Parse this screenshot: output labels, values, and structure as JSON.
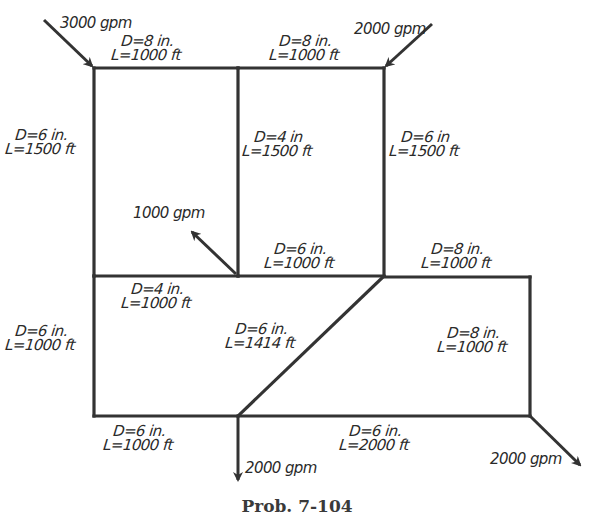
{
  "caption": "Prob. 7-104",
  "colors": {
    "line": "#333333",
    "text": "#2a2a2a",
    "background": "#ffffff"
  },
  "nodes": [
    {
      "id": "A",
      "x": 94,
      "y": 68
    },
    {
      "id": "B",
      "x": 238,
      "y": 68
    },
    {
      "id": "C",
      "x": 384,
      "y": 68
    },
    {
      "id": "D",
      "x": 94,
      "y": 276
    },
    {
      "id": "E",
      "x": 238,
      "y": 276
    },
    {
      "id": "F",
      "x": 384,
      "y": 276
    },
    {
      "id": "G",
      "x": 530,
      "y": 277
    },
    {
      "id": "H",
      "x": 94,
      "y": 416
    },
    {
      "id": "I",
      "x": 238,
      "y": 416
    },
    {
      "id": "J",
      "x": 530,
      "y": 416
    }
  ],
  "pipes": [
    {
      "from": "A",
      "to": "B",
      "diameter": "D=8 in.",
      "length": "L=1000 ft"
    },
    {
      "from": "B",
      "to": "C",
      "diameter": "D=8 in.",
      "length": "L=1000 ft"
    },
    {
      "from": "A",
      "to": "D",
      "diameter": "D=6 in.",
      "length": "L=1500 ft"
    },
    {
      "from": "B",
      "to": "E",
      "diameter": "D=4 in",
      "length": "L=1500 ft"
    },
    {
      "from": "C",
      "to": "F",
      "diameter": "D=6 in",
      "length": "L=1500 ft"
    },
    {
      "from": "E",
      "to": "F",
      "diameter": "D=6 in.",
      "length": "L=1000 ft"
    },
    {
      "from": "F",
      "to": "G",
      "diameter": "D=8 in.",
      "length": "L=1000 ft"
    },
    {
      "from": "D",
      "to": "E",
      "diameter": "D=4 in.",
      "length": "L=1000 ft"
    },
    {
      "from": "D",
      "to": "H",
      "diameter": "D=6 in.",
      "length": "L=1000 ft"
    },
    {
      "from": "F",
      "to": "I",
      "diameter": "D=6 in.",
      "length": "L=1414 ft"
    },
    {
      "from": "G",
      "to": "J",
      "diameter": "D=8 in.",
      "length": "L=1000 ft"
    },
    {
      "from": "H",
      "to": "I",
      "diameter": "D=6 in.",
      "length": "L=1000 ft"
    },
    {
      "from": "I",
      "to": "J",
      "diameter": "D=6 in.",
      "length": "L=2000 ft"
    }
  ],
  "flows": [
    {
      "node": "A",
      "direction": "inflow",
      "label": "3000 gpm"
    },
    {
      "node": "C",
      "direction": "inflow",
      "label": "2000 gpm"
    },
    {
      "node": "E",
      "direction": "outflow",
      "label": "1000 gpm"
    },
    {
      "node": "I",
      "direction": "outflow",
      "label": "2000 gpm"
    },
    {
      "node": "J",
      "direction": "outflow",
      "label": "2000 gpm"
    }
  ]
}
